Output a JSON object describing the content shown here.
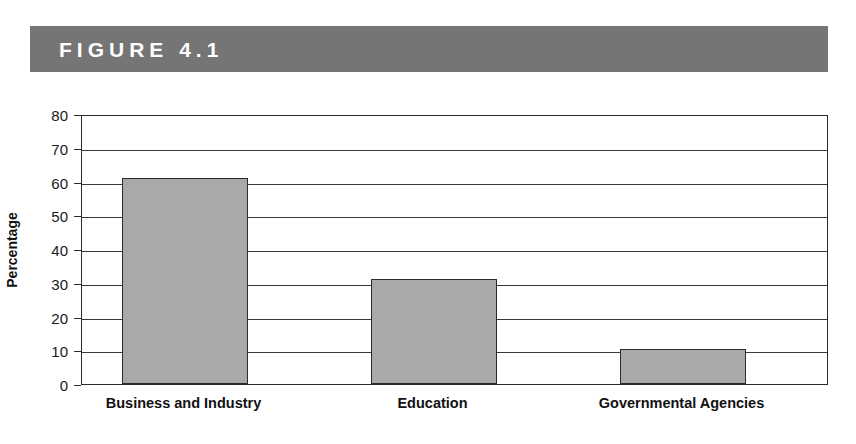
{
  "figure": {
    "banner_label": "FIGURE 4.1",
    "banner_color": "#757575",
    "banner_text_color": "#ffffff"
  },
  "colors": {
    "bar_fill": "#a9a9a9",
    "bar_stroke": "#2b2b2b",
    "gridline": "#3a3a3a",
    "axis": "#2b2b2b",
    "plot_background": "#ffffff",
    "text": "#111111"
  },
  "chart_data": {
    "type": "bar",
    "title": "",
    "subtitle": "",
    "xlabel": "",
    "ylabel": "Percentage",
    "categories": [
      "Business and Industry",
      "Education",
      "Governmental Agencies"
    ],
    "values": [
      61,
      31,
      10.5
    ],
    "ylim": [
      0,
      80
    ],
    "ytick_labels": [
      "80",
      "70",
      "60",
      "50",
      "40",
      "30",
      "20",
      "10",
      "0"
    ],
    "ytick_values": [
      80,
      70,
      60,
      50,
      40,
      30,
      20,
      10,
      0
    ],
    "ytick_step": 10,
    "grid": true,
    "grid_axis": "y",
    "legend": false,
    "legend_position": "none",
    "annotations": [],
    "series": [
      {
        "name": "Percentage",
        "values": [
          61,
          31,
          10.5
        ]
      }
    ]
  }
}
